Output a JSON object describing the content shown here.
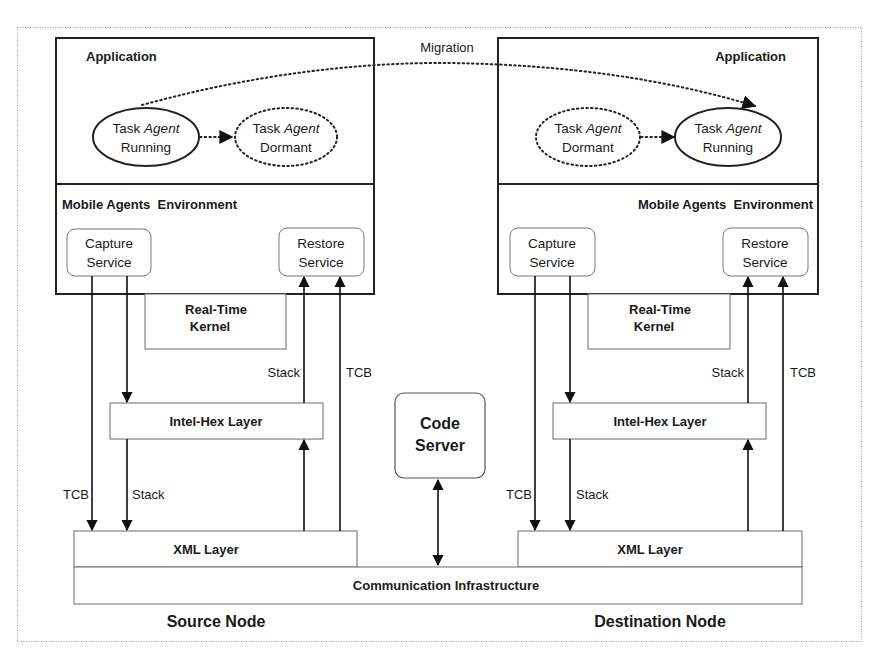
{
  "diagram": {
    "migration_label": "Migration",
    "source_node": {
      "label": "Source Node",
      "application_label": "Application",
      "agent_running": {
        "line1_a": "Task ",
        "line1_b": "Agent",
        "line2": "Running",
        "style": "solid"
      },
      "agent_dormant": {
        "line1_a": "Task ",
        "line1_b": "Agent",
        "line2": "Dormant",
        "style": "dotted"
      },
      "environment_label": "Mobile Agents  Environment",
      "capture_service": {
        "line1": "Capture",
        "line2": "Service"
      },
      "restore_service": {
        "line1": "Restore",
        "line2": "Service"
      },
      "kernel": {
        "line1": "Real-Time",
        "line2": "Kernel"
      },
      "intel_hex_layer": "Intel-Hex Layer",
      "xml_layer": "XML Layer",
      "arrow_labels": {
        "restore_stack": "Stack",
        "restore_tcb": "TCB",
        "capture_tcb": "TCB",
        "capture_stack": "Stack"
      }
    },
    "destination_node": {
      "label": "Destination Node",
      "application_label": "Application",
      "agent_dormant": {
        "line1_a": "Task ",
        "line1_b": "Agent",
        "line2": "Dormant",
        "style": "dotted"
      },
      "agent_running": {
        "line1_a": "Task ",
        "line1_b": "Agent",
        "line2": "Running",
        "style": "solid"
      },
      "environment_label": "Mobile Agents  Environment",
      "capture_service": {
        "line1": "Capture",
        "line2": "Service"
      },
      "restore_service": {
        "line1": "Restore",
        "line2": "Service"
      },
      "kernel": {
        "line1": "Real-Time",
        "line2": "Kernel"
      },
      "intel_hex_layer": "Intel-Hex Layer",
      "xml_layer": "XML Layer",
      "arrow_labels": {
        "restore_stack": "Stack",
        "restore_tcb": "TCB",
        "capture_tcb": "TCB",
        "capture_stack": "Stack"
      }
    },
    "code_server": {
      "line1": "Code",
      "line2": "Server"
    },
    "communication_infrastructure": "Communication Infrastructure"
  }
}
